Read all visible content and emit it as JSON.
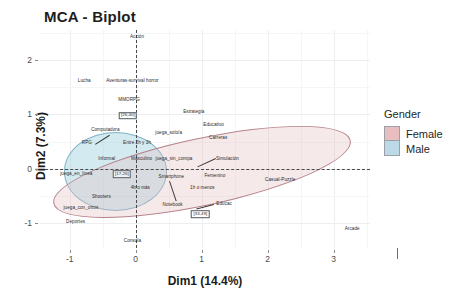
{
  "chart_data": {
    "type": "scatter",
    "title": "MCA - Biplot",
    "xlabel": "Dim1 (14.4%)",
    "ylabel": "Dim2 (7.3%)",
    "xlim": [
      -1.45,
      3.55
    ],
    "ylim": [
      -1.45,
      2.55
    ],
    "xticks": [
      "-1",
      "0",
      "1",
      "2",
      "3"
    ],
    "xtick_values": [
      -1,
      0,
      1,
      2,
      3
    ],
    "yticks": [
      "2",
      "1",
      "0",
      "-1"
    ],
    "ytick_values": [
      2,
      1,
      0,
      -1
    ],
    "grid": true,
    "reference_lines": {
      "x": 0,
      "y": 0,
      "style": "dashed"
    },
    "legend": {
      "position": "right",
      "title": "Gender",
      "entries": [
        {
          "label": "Female",
          "color": "#e8bdbf"
        },
        {
          "label": "Male",
          "color": "#bcd9e8"
        }
      ]
    },
    "ellipses": [
      {
        "group": "Male",
        "center": [
          -0.3,
          -0.05
        ],
        "rx": 0.78,
        "ry": 0.72,
        "angle": 0,
        "fill": "#96cdde",
        "stroke": "#7fb3c6"
      },
      {
        "group": "Female",
        "center": [
          1.0,
          -0.05
        ],
        "rx": 2.3,
        "ry": 0.62,
        "angle": -12,
        "fill": "#e2bcbe",
        "stroke": "#b5818a"
      }
    ],
    "points": [
      {
        "label": "Acción",
        "x": 0.02,
        "y": 2.42
      },
      {
        "label": "Lucha",
        "x": -0.78,
        "y": 1.62
      },
      {
        "label": "Aventuras-survival horror",
        "x": -0.05,
        "y": 1.62
      },
      {
        "label": "MMORPG",
        "x": -0.1,
        "y": 1.27
      },
      {
        "label": "[26,40]",
        "x": -0.12,
        "y": 0.98,
        "boxed": true
      },
      {
        "label": "Estrategia",
        "x": 0.88,
        "y": 1.05
      },
      {
        "label": "Educativo",
        "x": 1.18,
        "y": 0.8
      },
      {
        "label": "Computadora",
        "x": -0.46,
        "y": 0.71
      },
      {
        "label": "juega_solo/a",
        "x": 0.5,
        "y": 0.66
      },
      {
        "label": "Carreras",
        "x": 1.25,
        "y": 0.57
      },
      {
        "label": "RPG",
        "x": -0.74,
        "y": 0.48
      },
      {
        "label": "Entre 2h y 3h",
        "x": 0.02,
        "y": 0.47
      },
      {
        "label": "Simulación",
        "x": 1.39,
        "y": 0.19
      },
      {
        "label": "Informal",
        "x": -0.44,
        "y": 0.19
      },
      {
        "label": "Masculino",
        "x": 0.09,
        "y": 0.19
      },
      {
        "label": "juega_sin_compa",
        "x": 0.58,
        "y": 0.19
      },
      {
        "label": "juega_en_línea",
        "x": -0.9,
        "y": -0.09
      },
      {
        "label": "[17,26]",
        "x": -0.21,
        "y": -0.1,
        "boxed": true
      },
      {
        "label": "Smartphone",
        "x": 0.54,
        "y": -0.14
      },
      {
        "label": "Femenino",
        "x": 1.2,
        "y": -0.12
      },
      {
        "label": "Casual-Puzzle",
        "x": 2.19,
        "y": -0.21
      },
      {
        "label": "4h o más",
        "x": 0.07,
        "y": -0.34
      },
      {
        "label": "1h o menos",
        "x": 1.01,
        "y": -0.35
      },
      {
        "label": "Shooters",
        "x": -0.52,
        "y": -0.52
      },
      {
        "label": "Notebook",
        "x": 0.56,
        "y": -0.66
      },
      {
        "label": "Educac",
        "x": 1.34,
        "y": -0.65
      },
      {
        "label": "juega_con_otros",
        "x": -0.83,
        "y": -0.72
      },
      {
        "label": "[33,49]",
        "x": 0.98,
        "y": -0.83,
        "boxed": true
      },
      {
        "label": "Deportes",
        "x": -0.91,
        "y": -0.98
      },
      {
        "label": "Arcade",
        "x": 3.28,
        "y": -1.1
      },
      {
        "label": "Consola",
        "x": -0.05,
        "y": -1.32
      }
    ]
  }
}
